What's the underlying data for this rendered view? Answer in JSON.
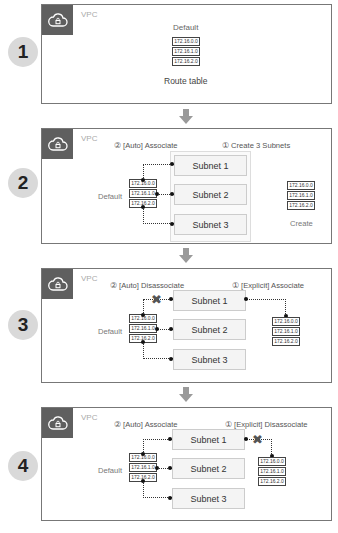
{
  "diagram": {
    "vpc_label": "VPC",
    "default_label": "Default",
    "route_table_entries": [
      "172.16.0.0",
      "172.16.1.0",
      "172.16.2.0"
    ],
    "subnets": [
      "Subnet 1",
      "Subnet 2",
      "Subnet 3"
    ],
    "icons": {
      "vpc": "cloud-lock-icon",
      "flow": "arrow-down-icon",
      "removed": "x-mark-icon"
    },
    "colors": {
      "icon_bg": "#5f5f5f",
      "step_circle": "#d9d9d9",
      "arrow": "#9a9a9a",
      "border": "#777777"
    }
  },
  "steps": [
    {
      "number": "1",
      "caption": "Route table",
      "default_label": "Default"
    },
    {
      "number": "2",
      "left_header": "② [Auto] Associate",
      "right_header": "① Create 3 Subnets",
      "right_label": "Create"
    },
    {
      "number": "3",
      "left_header": "② [Auto] Disassociate",
      "right_header": "① [Explicit] Associate"
    },
    {
      "number": "4",
      "left_header": "② [Auto] Associate",
      "right_header": "① [Explicit] Disassociate"
    }
  ],
  "symbols": {
    "x": "✖"
  }
}
